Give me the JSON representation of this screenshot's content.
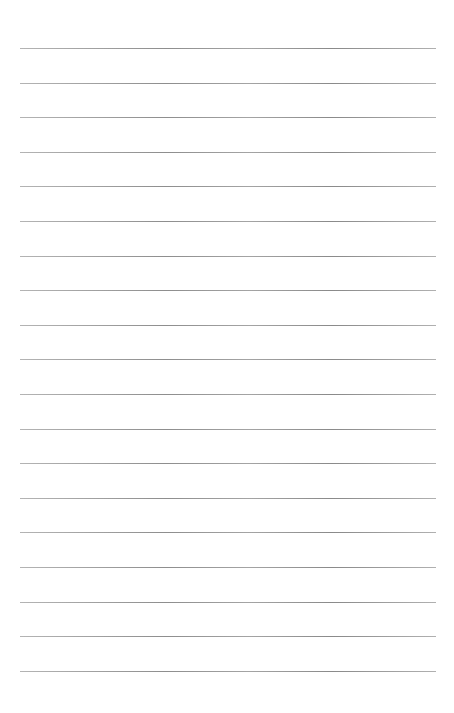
{
  "page": {
    "background": "#ffffff",
    "rule_color": "#999999",
    "rule_count": 19,
    "first_rule_y": 48,
    "rule_spacing": 34.6,
    "rule_left": 20,
    "rule_width": 416
  }
}
